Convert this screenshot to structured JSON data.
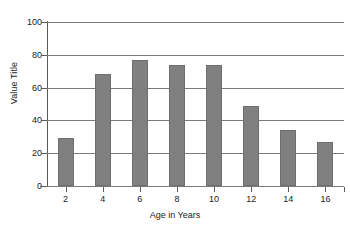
{
  "chart_data": {
    "type": "bar",
    "title": "",
    "xlabel": "Age in Years",
    "ylabel": "Value Title",
    "categories": [
      "2",
      "4",
      "6",
      "8",
      "10",
      "12",
      "14",
      "16"
    ],
    "values": [
      29,
      68,
      77,
      74,
      74,
      49,
      34,
      27
    ],
    "series": [
      {
        "name": "Value Title",
        "values": [
          29,
          68,
          77,
          74,
          74,
          49,
          34,
          27
        ]
      }
    ],
    "ylim": [
      0,
      100
    ],
    "y_ticks": [
      "0",
      "20",
      "40",
      "60",
      "80",
      "100"
    ],
    "y_tick_values": [
      0,
      20,
      40,
      60,
      80,
      100
    ],
    "x_ticks": [
      "2",
      "4",
      "6",
      "8",
      "10",
      "12",
      "14",
      "16"
    ],
    "grid": true,
    "grid_axis": "y",
    "legend": false,
    "legend_position": "none",
    "bar_color": "#808080",
    "bar_edge_color": "#6e6e6e",
    "gridline_color": "#7a7a7a",
    "axis_color": "#5a5a5a",
    "background_color": "#ffffff",
    "text_color": "#1a1a1a"
  },
  "axes": {
    "y_title": "Value Title",
    "x_title": "Age in Years"
  }
}
